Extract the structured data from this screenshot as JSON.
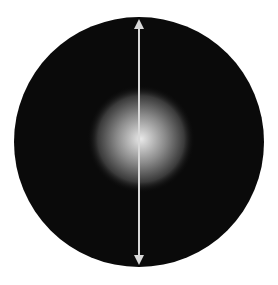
{
  "diagram": {
    "title": "",
    "canvas": {
      "width": 278,
      "height": 285,
      "background": "#ffffff"
    },
    "disk": {
      "cx": 139,
      "cy": 142,
      "r": 125,
      "color": "#0a0a0a"
    },
    "glow": {
      "cx": 141,
      "cy": 139,
      "r": 54,
      "core_color": "#e8e8e8",
      "mid_color": "#8a8a8a",
      "edge_color": "#0a0a0a"
    },
    "arrow": {
      "x": 139,
      "y1": 15,
      "y2": 269,
      "color": "#d8d8d8",
      "width": 2,
      "style": "double-headed",
      "icon": "double-arrow-vertical-icon"
    }
  }
}
